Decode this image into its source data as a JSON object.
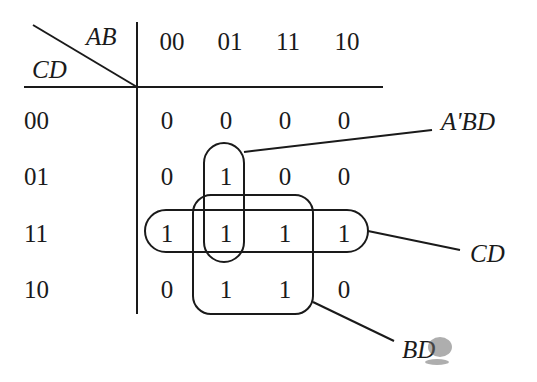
{
  "corner": {
    "col_vars": "AB",
    "row_vars": "CD"
  },
  "columns": [
    {
      "label": "00"
    },
    {
      "label": "01"
    },
    {
      "label": "11"
    },
    {
      "label": "10"
    }
  ],
  "rows": [
    {
      "label": "00",
      "cells": [
        "0",
        "0",
        "0",
        "0"
      ]
    },
    {
      "label": "01",
      "cells": [
        "0",
        "1",
        "0",
        "0"
      ]
    },
    {
      "label": "11",
      "cells": [
        "1",
        "1",
        "1",
        "1"
      ]
    },
    {
      "label": "10",
      "cells": [
        "0",
        "1",
        "1",
        "0"
      ]
    }
  ],
  "groups": [
    {
      "name": "A'BD",
      "label": "A'BD",
      "cells": "column 01, rows 01-11"
    },
    {
      "name": "CD",
      "label": "CD",
      "cells": "row 11, all columns"
    },
    {
      "name": "BD",
      "label": "BD",
      "cells": "columns 01-11, rows 11-10"
    }
  ],
  "colors": {
    "ink": "#1a1a1a",
    "background": "#ffffff"
  }
}
